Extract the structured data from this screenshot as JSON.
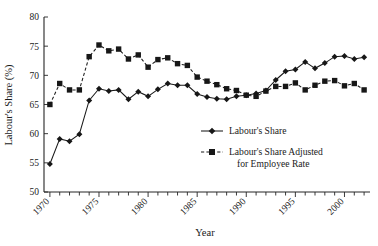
{
  "chart_data": {
    "type": "line",
    "title": "",
    "subtitle": "",
    "xlabel": "Year",
    "ylabel": "Labour's Share (%)",
    "xlim": [
      1969.4,
      2002.6
    ],
    "ylim": [
      50,
      80
    ],
    "yticks": [
      50,
      55,
      60,
      65,
      70,
      75,
      80
    ],
    "ytick_labels": [
      "50",
      "55",
      "60",
      "65",
      "70",
      "75",
      "80"
    ],
    "xticks": [
      1970,
      1975,
      1980,
      1985,
      1990,
      1995,
      2000
    ],
    "xtick_labels": [
      "1970",
      "1975",
      "1980",
      "1985",
      "1990",
      "1995",
      "2000"
    ],
    "xtick_minor_every": 1,
    "xtick_label_rotation": -45,
    "grid": false,
    "legend_position": "center-right-inside",
    "x": [
      1970,
      1971,
      1972,
      1973,
      1974,
      1975,
      1976,
      1977,
      1978,
      1979,
      1980,
      1981,
      1982,
      1983,
      1984,
      1985,
      1986,
      1987,
      1988,
      1989,
      1990,
      1991,
      1992,
      1993,
      1994,
      1995,
      1996,
      1997,
      1998,
      1999,
      2000,
      2001,
      2002
    ],
    "series": [
      {
        "name": "Labour's Share",
        "marker": "diamond",
        "linestyle": "solid",
        "color": "#171717",
        "values": [
          54.8,
          59.1,
          58.7,
          59.9,
          65.7,
          67.7,
          67.3,
          67.5,
          65.9,
          67.2,
          66.4,
          67.6,
          68.6,
          68.3,
          68.3,
          66.8,
          66.3,
          66.0,
          65.9,
          66.4,
          66.6,
          66.9,
          67.4,
          69.2,
          70.7,
          71.0,
          72.3,
          71.2,
          72.1,
          73.2,
          73.3,
          72.8,
          73.1
        ]
      },
      {
        "name": "Labour's Share Adjusted for Employee Rate",
        "marker": "square",
        "linestyle": "dashed",
        "color": "#171717",
        "values": [
          65.0,
          68.6,
          67.5,
          67.5,
          73.2,
          75.2,
          74.2,
          74.5,
          72.8,
          73.5,
          71.4,
          72.7,
          73.0,
          72.0,
          71.7,
          69.7,
          69.0,
          68.4,
          67.7,
          67.4,
          66.6,
          66.4,
          67.3,
          68.1,
          68.1,
          68.7,
          67.5,
          68.3,
          69.0,
          69.1,
          68.2,
          68.6,
          67.5
        ]
      }
    ],
    "legend": [
      {
        "label": "Labour's Share",
        "marker": "diamond",
        "linestyle": "solid"
      },
      {
        "label": "Labour's Share Adjusted",
        "label_line2": "for Employee Rate",
        "marker": "square",
        "linestyle": "dashed"
      }
    ]
  },
  "colors": {
    "ink": "#171717",
    "axis": "#262626",
    "background": "#ffffff"
  }
}
